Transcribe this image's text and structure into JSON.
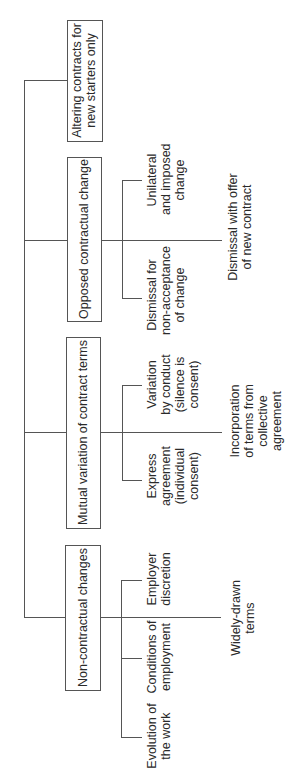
{
  "diagram": {
    "orientation": "rotated-90-ccw",
    "line_color": "#555555",
    "categories": [
      {
        "label": "Altering contracts for new starters only",
        "line1": "Altering contracts for",
        "line2": "new starters only",
        "children": [],
        "extension": null
      },
      {
        "label": "Opposed contractual change",
        "line1": "Opposed contractual change",
        "children": [
          {
            "line1": "Unilateral",
            "line2": "and imposed",
            "line3": "change"
          },
          {
            "line1": "Dismissal for",
            "line2": "non-acceptance",
            "line3": "of change"
          }
        ],
        "extension": {
          "line1": "Dismissal with offer",
          "line2": "of new contract"
        }
      },
      {
        "label": "Mutual variation of contract terms",
        "line1": "Mutual variation of contract terms",
        "children": [
          {
            "line1": "Variation",
            "line2": "by conduct",
            "line3": "(silence is",
            "line4": "consent)"
          },
          {
            "line1": "Express",
            "line2": "agreement",
            "line3": "(individual",
            "line4": "consent)"
          }
        ],
        "extension": {
          "line1": "Incorporation",
          "line2": "of terms from",
          "line3": "collective",
          "line4": "agreement"
        }
      },
      {
        "label": "Non-contractual changes",
        "line1": "Non-contractual changes",
        "children": [
          {
            "line1": "Employer",
            "line2": "discretion"
          },
          {
            "line1": "Conditions of",
            "line2": "employment"
          },
          {
            "line1": "Evolution of",
            "line2": "the work"
          }
        ],
        "extension": {
          "line1": "Widely-drawn",
          "line2": "terms"
        }
      }
    ]
  }
}
